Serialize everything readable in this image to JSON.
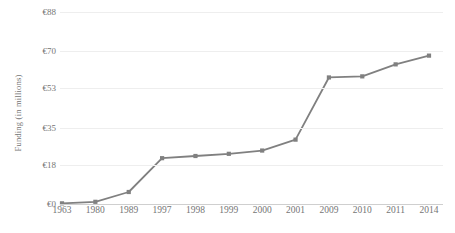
{
  "chart_data": {
    "type": "line",
    "title": "",
    "subtitle": "",
    "xlabel": "",
    "ylabel": "Funding (in millions)",
    "categories": [
      "1963",
      "1980",
      "1989",
      "1997",
      "1998",
      "1999",
      "2000",
      "2001",
      "2009",
      "2010",
      "2011",
      "2014"
    ],
    "values": [
      0.3,
      1.0,
      5.5,
      21.0,
      22.0,
      23.0,
      24.5,
      29.5,
      58.0,
      58.5,
      64.0,
      68.0
    ],
    "series": [
      {
        "name": "Funding",
        "values": [
          0.3,
          1.0,
          5.5,
          21.0,
          22.0,
          23.0,
          24.5,
          29.5,
          58.0,
          58.5,
          64.0,
          68.0
        ]
      }
    ],
    "ytick_labels": [
      "€0",
      "€18",
      "€35",
      "€53",
      "€70",
      "€88"
    ],
    "ytick_values": [
      0,
      18,
      35,
      53,
      70,
      88
    ],
    "ylim": [
      0,
      88
    ],
    "grid": true,
    "legend": false,
    "legend_position": "none",
    "marker": "square",
    "colors": {
      "line": "#808080",
      "marker": "#808080",
      "gridline": "#eeeeee",
      "text": "#757575",
      "background": "#ffffff"
    }
  }
}
